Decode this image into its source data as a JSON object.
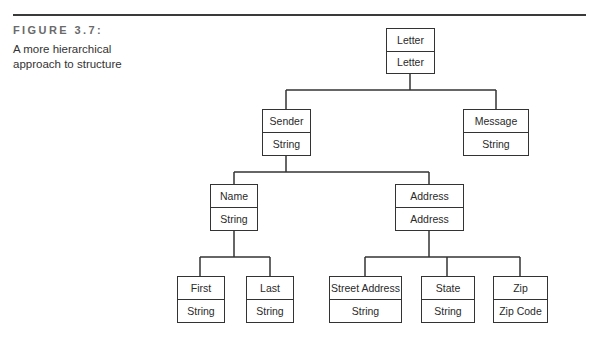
{
  "figure": {
    "label": "FIGURE 3.7:",
    "caption": "A more hierarchical approach to structure"
  },
  "diagram": {
    "type": "tree",
    "nodes": {
      "letter": {
        "name": "Letter",
        "type": "Letter"
      },
      "sender": {
        "name": "Sender",
        "type": "String"
      },
      "message": {
        "name": "Message",
        "type": "String"
      },
      "name": {
        "name": "Name",
        "type": "String"
      },
      "address": {
        "name": "Address",
        "type": "Address"
      },
      "first": {
        "name": "First",
        "type": "String"
      },
      "last": {
        "name": "Last",
        "type": "String"
      },
      "street": {
        "name": "Street Address",
        "type": "String"
      },
      "state": {
        "name": "State",
        "type": "String"
      },
      "zip": {
        "name": "Zip",
        "type": "Zip Code"
      }
    },
    "edges": [
      [
        "letter",
        "sender"
      ],
      [
        "letter",
        "message"
      ],
      [
        "sender",
        "name"
      ],
      [
        "sender",
        "address"
      ],
      [
        "name",
        "first"
      ],
      [
        "name",
        "last"
      ],
      [
        "address",
        "street"
      ],
      [
        "address",
        "state"
      ],
      [
        "address",
        "zip"
      ]
    ],
    "line_color": "#333333"
  }
}
